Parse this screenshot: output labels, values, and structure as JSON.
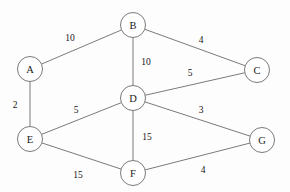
{
  "diagram": {
    "type": "weighted-undirected-graph",
    "canvas": {
      "width": 290,
      "height": 192,
      "background": "#fdfdfd"
    },
    "style": {
      "node_stroke": "#6b6b6b",
      "node_fill": "#ffffff",
      "edge_stroke": "#6b6b6b",
      "label_color": "#1a1a1a",
      "weight_color": "#141414",
      "node_radius": 12.5
    },
    "nodes": [
      {
        "id": "A",
        "label": "A",
        "x": 30,
        "y": 69,
        "r": 12.5
      },
      {
        "id": "B",
        "label": "B",
        "x": 133,
        "y": 25,
        "r": 12.5
      },
      {
        "id": "C",
        "label": "C",
        "x": 257,
        "y": 70,
        "r": 12.5
      },
      {
        "id": "D",
        "label": "D",
        "x": 133,
        "y": 98,
        "r": 12.5
      },
      {
        "id": "E",
        "label": "E",
        "x": 30,
        "y": 139,
        "r": 12.5
      },
      {
        "id": "F",
        "label": "F",
        "x": 133,
        "y": 173,
        "r": 12.5
      },
      {
        "id": "G",
        "label": "G",
        "x": 262,
        "y": 140,
        "r": 12.5
      }
    ],
    "edges": [
      {
        "id": "A-B",
        "from": "A",
        "to": "B",
        "weight": "10",
        "label_x": 70,
        "label_y": 38
      },
      {
        "id": "B-C",
        "from": "B",
        "to": "C",
        "weight": "4",
        "label_x": 201,
        "label_y": 40
      },
      {
        "id": "B-D",
        "from": "B",
        "to": "D",
        "weight": "10",
        "label_x": 146,
        "label_y": 62
      },
      {
        "id": "D-C",
        "from": "D",
        "to": "C",
        "weight": "5",
        "label_x": 190,
        "label_y": 73
      },
      {
        "id": "A-E",
        "from": "A",
        "to": "E",
        "weight": "2",
        "label_x": 15,
        "label_y": 105
      },
      {
        "id": "E-D",
        "from": "E",
        "to": "D",
        "weight": "5",
        "label_x": 76,
        "label_y": 110
      },
      {
        "id": "D-G",
        "from": "D",
        "to": "G",
        "weight": "3",
        "label_x": 201,
        "label_y": 110
      },
      {
        "id": "D-F",
        "from": "D",
        "to": "F",
        "weight": "15",
        "label_x": 147,
        "label_y": 137
      },
      {
        "id": "E-F",
        "from": "E",
        "to": "F",
        "weight": "15",
        "label_x": 78,
        "label_y": 175
      },
      {
        "id": "F-G",
        "from": "F",
        "to": "G",
        "weight": "4",
        "label_x": 203,
        "label_y": 170
      }
    ]
  }
}
